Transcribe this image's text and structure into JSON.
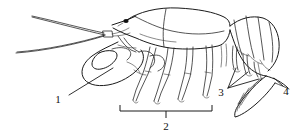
{
  "figure": {
    "view": "left lateral",
    "style": "black and white line art",
    "background_color": "#ffffff",
    "ink_color": "#1a1a1a"
  },
  "labels": [
    {
      "id": "1",
      "text": "1",
      "x": 61,
      "y": 99,
      "target": "cheliped-claw",
      "leader": "line"
    },
    {
      "id": "2",
      "text": "2",
      "x": 166,
      "y": 128,
      "target": "walking-legs",
      "leader": "bracket"
    },
    {
      "id": "3",
      "text": "3",
      "x": 221,
      "y": 94,
      "target": "swimmerets",
      "leader": "fan-lines"
    },
    {
      "id": "4",
      "text": "4",
      "x": 285,
      "y": 93,
      "target": "tail-fan",
      "leader": "line"
    }
  ],
  "bracket": {
    "label": "2",
    "left_x": 120,
    "right_x": 212,
    "y": 111,
    "tick_height": 6,
    "center_x": 166
  }
}
